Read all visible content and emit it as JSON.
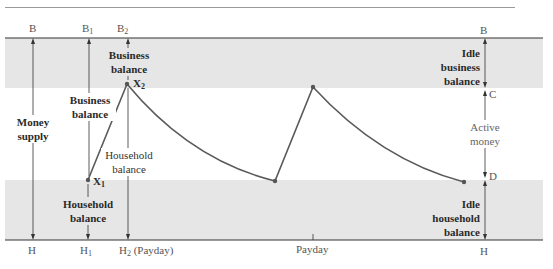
{
  "diagram": {
    "title": "",
    "top_labels": {
      "B": "B",
      "B1": "B",
      "B1_sub": "1",
      "B2": "B",
      "B2_sub": "2",
      "B_right": "B"
    },
    "bottom_labels": {
      "H": "H",
      "H1": "H",
      "H1_sub": "1",
      "H2": "H",
      "H2_sub": "2",
      "H2_note": "(Payday)",
      "payday": "Payday",
      "H_right": "H"
    },
    "left_annotations": {
      "money_supply_line1": "Money",
      "money_supply_line2": "supply",
      "business_balance_b1_line1": "Business",
      "business_balance_b1_line2": "balance",
      "business_balance_b2_line1": "Business",
      "business_balance_b2_line2": "balance",
      "household_balance_h2_line1": "Household",
      "household_balance_h2_line2": "balance",
      "household_balance_h1_line1": "Household",
      "household_balance_h1_line2": "balance"
    },
    "points": {
      "X1": "X",
      "X1_sub": "1",
      "X2": "X",
      "X2_sub": "2"
    },
    "right_annotations": {
      "idle_business_line1": "Idle",
      "idle_business_line2": "business",
      "idle_business_line3": "balance",
      "C": "C",
      "active_money_line1": "Active",
      "active_money_line2": "money",
      "D": "D",
      "idle_household_line1": "Idle",
      "idle_household_line2": "household",
      "idle_household_line3": "balance"
    },
    "colors": {
      "band": "#e6e6e6",
      "curve": "#5a5a5a",
      "axis": "#3a3a3a"
    }
  }
}
